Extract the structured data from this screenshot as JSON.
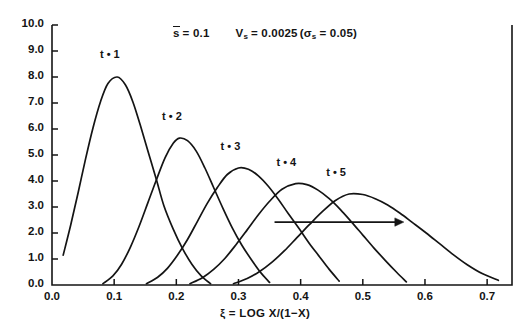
{
  "chart_data": {
    "type": "line",
    "title_parts": {
      "mean_symbol": "s",
      "mean_eq": "= 0.1",
      "variance_symbol": "V",
      "variance_sub": "s",
      "variance_eq": "= 0.0025",
      "sigma_open": "(",
      "sigma_symbol": "σ",
      "sigma_sub": "s",
      "sigma_eq": "= 0.05",
      "sigma_close": ")"
    },
    "xlabel": "ξ = LOG X/(1−X)",
    "ylabel": "",
    "xlim": [
      0.0,
      0.74
    ],
    "ylim": [
      0.0,
      10.0
    ],
    "xticks": [
      0.0,
      0.1,
      0.2,
      0.3,
      0.4,
      0.5,
      0.6,
      0.7
    ],
    "xtick_labels": [
      "0.0",
      "0.1",
      "0.2",
      "0.3",
      "0.4",
      "0.5",
      "0.6",
      "0.7"
    ],
    "yticks": [
      0.0,
      1.0,
      2.0,
      3.0,
      4.0,
      5.0,
      6.0,
      7.0,
      8.0,
      9.0,
      10.0
    ],
    "ytick_labels": [
      "0.0",
      "1.0",
      "2.0",
      "3.0",
      "4.0",
      "5.0",
      "6.0",
      "7.0",
      "8.0",
      "9.0",
      "10.0"
    ],
    "grid": false,
    "legend": "inline-curve-labels",
    "line_color": "#141414",
    "series": [
      {
        "name": "t = 1",
        "label": "t • 1",
        "label_x": 0.098,
        "label_y": 8.85,
        "peak_x": 0.105,
        "peak_y": 8.0,
        "start_x": 0.018,
        "end_x": 0.255,
        "start_y": 1.15,
        "end_y": 0.0,
        "points": [
          [
            0.018,
            1.15
          ],
          [
            0.03,
            2.3
          ],
          [
            0.042,
            3.55
          ],
          [
            0.054,
            4.85
          ],
          [
            0.066,
            6.05
          ],
          [
            0.078,
            7.05
          ],
          [
            0.09,
            7.75
          ],
          [
            0.105,
            8.0
          ],
          [
            0.118,
            7.7
          ],
          [
            0.13,
            7.05
          ],
          [
            0.142,
            6.15
          ],
          [
            0.155,
            5.1
          ],
          [
            0.168,
            4.05
          ],
          [
            0.18,
            3.05
          ],
          [
            0.195,
            2.15
          ],
          [
            0.21,
            1.4
          ],
          [
            0.225,
            0.8
          ],
          [
            0.24,
            0.35
          ],
          [
            0.255,
            0.05
          ]
        ]
      },
      {
        "name": "t = 2",
        "label": "t • 2",
        "label_x": 0.198,
        "label_y": 6.45,
        "peak_x": 0.205,
        "peak_y": 5.65,
        "start_x": 0.082,
        "end_x": 0.35,
        "start_y": 0.05,
        "end_y": 0.0,
        "points": [
          [
            0.082,
            0.05
          ],
          [
            0.098,
            0.35
          ],
          [
            0.112,
            0.8
          ],
          [
            0.126,
            1.45
          ],
          [
            0.14,
            2.25
          ],
          [
            0.154,
            3.15
          ],
          [
            0.168,
            4.05
          ],
          [
            0.182,
            4.9
          ],
          [
            0.195,
            5.45
          ],
          [
            0.205,
            5.65
          ],
          [
            0.218,
            5.55
          ],
          [
            0.232,
            5.15
          ],
          [
            0.246,
            4.5
          ],
          [
            0.26,
            3.75
          ],
          [
            0.275,
            2.95
          ],
          [
            0.29,
            2.2
          ],
          [
            0.305,
            1.55
          ],
          [
            0.32,
            1.0
          ],
          [
            0.335,
            0.5
          ],
          [
            0.35,
            0.1
          ]
        ]
      },
      {
        "name": "t = 3",
        "label": "t • 3",
        "label_x": 0.292,
        "label_y": 5.3,
        "peak_x": 0.3,
        "peak_y": 4.5,
        "start_x": 0.152,
        "end_x": 0.462,
        "start_y": 0.05,
        "end_y": 0.0,
        "points": [
          [
            0.152,
            0.05
          ],
          [
            0.17,
            0.3
          ],
          [
            0.186,
            0.65
          ],
          [
            0.202,
            1.15
          ],
          [
            0.218,
            1.75
          ],
          [
            0.234,
            2.45
          ],
          [
            0.25,
            3.15
          ],
          [
            0.266,
            3.75
          ],
          [
            0.282,
            4.25
          ],
          [
            0.3,
            4.5
          ],
          [
            0.316,
            4.45
          ],
          [
            0.332,
            4.2
          ],
          [
            0.348,
            3.8
          ],
          [
            0.364,
            3.3
          ],
          [
            0.38,
            2.75
          ],
          [
            0.398,
            2.15
          ],
          [
            0.414,
            1.6
          ],
          [
            0.43,
            1.1
          ],
          [
            0.446,
            0.6
          ],
          [
            0.462,
            0.15
          ]
        ]
      },
      {
        "name": "t = 4",
        "label": "t • 4",
        "label_x": 0.382,
        "label_y": 4.7,
        "peak_x": 0.392,
        "peak_y": 3.9,
        "start_x": 0.222,
        "end_x": 0.57,
        "start_y": 0.05,
        "end_y": 0.0,
        "points": [
          [
            0.222,
            0.05
          ],
          [
            0.242,
            0.28
          ],
          [
            0.26,
            0.6
          ],
          [
            0.278,
            1.02
          ],
          [
            0.296,
            1.55
          ],
          [
            0.314,
            2.12
          ],
          [
            0.332,
            2.7
          ],
          [
            0.35,
            3.22
          ],
          [
            0.37,
            3.68
          ],
          [
            0.392,
            3.9
          ],
          [
            0.41,
            3.86
          ],
          [
            0.428,
            3.65
          ],
          [
            0.446,
            3.32
          ],
          [
            0.464,
            2.9
          ],
          [
            0.482,
            2.42
          ],
          [
            0.5,
            1.92
          ],
          [
            0.518,
            1.42
          ],
          [
            0.536,
            0.95
          ],
          [
            0.554,
            0.5
          ],
          [
            0.57,
            0.12
          ]
        ]
      },
      {
        "name": "t = 5",
        "label": "t • 5",
        "label_x": 0.462,
        "label_y": 4.3,
        "peak_x": 0.478,
        "peak_y": 3.5,
        "start_x": 0.292,
        "end_x": 0.718,
        "start_y": 0.05,
        "end_y": 0.18,
        "points": [
          [
            0.292,
            0.05
          ],
          [
            0.314,
            0.25
          ],
          [
            0.334,
            0.52
          ],
          [
            0.354,
            0.88
          ],
          [
            0.374,
            1.32
          ],
          [
            0.394,
            1.82
          ],
          [
            0.414,
            2.32
          ],
          [
            0.434,
            2.8
          ],
          [
            0.456,
            3.25
          ],
          [
            0.478,
            3.5
          ],
          [
            0.5,
            3.48
          ],
          [
            0.52,
            3.32
          ],
          [
            0.54,
            3.08
          ],
          [
            0.56,
            2.76
          ],
          [
            0.58,
            2.4
          ],
          [
            0.602,
            2.0
          ],
          [
            0.624,
            1.58
          ],
          [
            0.646,
            1.16
          ],
          [
            0.668,
            0.78
          ],
          [
            0.692,
            0.44
          ],
          [
            0.718,
            0.18
          ]
        ]
      }
    ],
    "annotations": [
      {
        "name": "direction-arrow",
        "type": "arrow",
        "x_start": 0.358,
        "x_end": 0.566,
        "y": 2.42,
        "direction": "right"
      }
    ]
  }
}
